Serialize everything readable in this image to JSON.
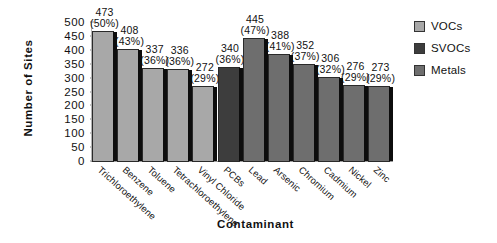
{
  "chart_data": {
    "type": "bar",
    "title": "",
    "xlabel": "Contaminant",
    "ylabel": "Number of Sites",
    "ylim": [
      0,
      500
    ],
    "yticks": [
      500,
      450,
      400,
      350,
      300,
      250,
      200,
      150,
      100,
      50,
      0
    ],
    "grid": false,
    "legend_position": "top-right",
    "categories": [
      "Trichloroethylene",
      "Benzene",
      "Toluene",
      "Tetrachloroethylene",
      "Vinyl Chloride",
      "PCBs",
      "Lead",
      "Arsenic",
      "Chromium",
      "Cadmium",
      "Nickel",
      "Zinc"
    ],
    "values": [
      473,
      408,
      337,
      336,
      272,
      340,
      445,
      388,
      352,
      306,
      276,
      273
    ],
    "percent_labels": [
      "(50%)",
      "(43%)",
      "(36%)",
      "(36%)",
      "(29%)",
      "(36%)",
      "(47%)",
      "(41%)",
      "(37%)",
      "(32%)",
      "(29%)",
      "(29%)"
    ],
    "groups": [
      "VOCs",
      "VOCs",
      "VOCs",
      "VOCs",
      "VOCs",
      "SVOCs",
      "Metals",
      "Metals",
      "Metals",
      "Metals",
      "Metals",
      "Metals"
    ],
    "series": [
      {
        "name": "VOCs",
        "color": "#a8a8a8",
        "points": [
          {
            "category": "Trichloroethylene",
            "value": 473,
            "percent": "(50%)"
          },
          {
            "category": "Benzene",
            "value": 408,
            "percent": "(43%)"
          },
          {
            "category": "Toluene",
            "value": 337,
            "percent": "(36%)"
          },
          {
            "category": "Tetrachloroethylene",
            "value": 336,
            "percent": "(36%)"
          },
          {
            "category": "Vinyl Chloride",
            "value": 272,
            "percent": "(29%)"
          }
        ]
      },
      {
        "name": "SVOCs",
        "color": "#3d3d3d",
        "points": [
          {
            "category": "PCBs",
            "value": 340,
            "percent": "(36%)"
          }
        ]
      },
      {
        "name": "Metals",
        "color": "#6e6e6e",
        "points": [
          {
            "category": "Lead",
            "value": 445,
            "percent": "(47%)"
          },
          {
            "category": "Arsenic",
            "value": 388,
            "percent": "(41%)"
          },
          {
            "category": "Chromium",
            "value": 352,
            "percent": "(37%)"
          },
          {
            "category": "Cadmium",
            "value": 306,
            "percent": "(32%)"
          },
          {
            "category": "Nickel",
            "value": 276,
            "percent": "(29%)"
          },
          {
            "category": "Zinc",
            "value": 273,
            "percent": "(29%)"
          }
        ]
      }
    ]
  },
  "legend": {
    "items": [
      {
        "label": "VOCs",
        "color": "#a8a8a8"
      },
      {
        "label": "SVOCs",
        "color": "#3d3d3d"
      },
      {
        "label": "Metals",
        "color": "#6e6e6e"
      }
    ]
  }
}
